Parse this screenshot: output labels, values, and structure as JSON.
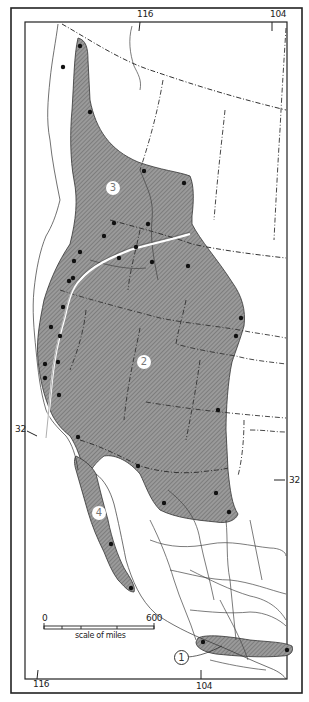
{
  "map": {
    "longitude_labels_top": [
      {
        "text": "116",
        "x": 137,
        "y": 10
      },
      {
        "text": "104",
        "x": 270,
        "y": 10
      }
    ],
    "longitude_labels_bottom": [
      {
        "text": "116",
        "x": 33,
        "y": 680
      },
      {
        "text": "104",
        "x": 196,
        "y": 682
      }
    ],
    "latitude_labels": [
      {
        "text": "32",
        "x": 15,
        "y": 425
      },
      {
        "text": "32",
        "x": 289,
        "y": 476
      }
    ],
    "range_labels": [
      {
        "id": "1",
        "text": "1",
        "x": 174,
        "y": 650
      },
      {
        "id": "2",
        "text": "2",
        "x": 137,
        "y": 355
      },
      {
        "id": "3",
        "text": "3",
        "x": 106,
        "y": 181
      },
      {
        "id": "4",
        "text": "4",
        "x": 92,
        "y": 506
      }
    ],
    "scale_bar": {
      "start_label": "0",
      "end_label": "600",
      "caption": "scale of miles"
    },
    "colors": {
      "range_fill": "#8c8c8c",
      "frame": "#222222",
      "border_line": "#333333",
      "dot": "#111111"
    },
    "locality_dots": [
      [
        80,
        46
      ],
      [
        63,
        67
      ],
      [
        90,
        112
      ],
      [
        144,
        171
      ],
      [
        184,
        183
      ],
      [
        114,
        223
      ],
      [
        148,
        224
      ],
      [
        104,
        236
      ],
      [
        136,
        247
      ],
      [
        80,
        252
      ],
      [
        119,
        258
      ],
      [
        74,
        261
      ],
      [
        152,
        262
      ],
      [
        188,
        266
      ],
      [
        73,
        278
      ],
      [
        69,
        281
      ],
      [
        63,
        307
      ],
      [
        51,
        327
      ],
      [
        60,
        336
      ],
      [
        241,
        318
      ],
      [
        236,
        336
      ],
      [
        45,
        364
      ],
      [
        58,
        362
      ],
      [
        45,
        378
      ],
      [
        59,
        395
      ],
      [
        218,
        410
      ],
      [
        78,
        437
      ],
      [
        138,
        466
      ],
      [
        164,
        503
      ],
      [
        216,
        493
      ],
      [
        229,
        512
      ],
      [
        111,
        544
      ],
      [
        131,
        588
      ],
      [
        203,
        642
      ],
      [
        287,
        650
      ]
    ]
  }
}
